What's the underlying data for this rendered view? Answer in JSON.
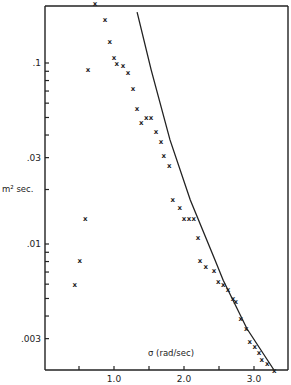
{
  "chart_data": {
    "type": "scatter",
    "title": "",
    "xlabel": "σ (rad/sec)",
    "ylabel": "m² sec.",
    "xlim": [
      0.0,
      3.5
    ],
    "ylim": [
      0.002,
      0.21
    ],
    "yscale": "log",
    "grid": false,
    "x_ticks": [
      {
        "value": 0.5,
        "label": ""
      },
      {
        "value": 1.0,
        "label": "1.0"
      },
      {
        "value": 1.5,
        "label": ""
      },
      {
        "value": 2.0,
        "label": "2.0"
      },
      {
        "value": 2.5,
        "label": ""
      },
      {
        "value": 3.0,
        "label": "3.0"
      }
    ],
    "y_ticks": [
      {
        "value": 0.1,
        "label": ".1"
      },
      {
        "value": 0.09,
        "label": ""
      },
      {
        "value": 0.08,
        "label": ""
      },
      {
        "value": 0.07,
        "label": ""
      },
      {
        "value": 0.06,
        "label": ""
      },
      {
        "value": 0.05,
        "label": ""
      },
      {
        "value": 0.04,
        "label": ""
      },
      {
        "value": 0.03,
        "label": ".03"
      },
      {
        "value": 0.02,
        "label": ""
      },
      {
        "value": 0.01,
        "label": ".01"
      },
      {
        "value": 0.009,
        "label": ""
      },
      {
        "value": 0.008,
        "label": ""
      },
      {
        "value": 0.007,
        "label": ""
      },
      {
        "value": 0.006,
        "label": ""
      },
      {
        "value": 0.005,
        "label": ""
      },
      {
        "value": 0.004,
        "label": ""
      },
      {
        "value": 0.003,
        "label": ".003"
      }
    ],
    "series": [
      {
        "name": "measured",
        "marker": "x",
        "points": [
          [
            0.73,
            0.214
          ],
          [
            0.87,
            0.175
          ],
          [
            0.94,
            0.131
          ],
          [
            1.0,
            0.107
          ],
          [
            1.04,
            0.099
          ],
          [
            1.13,
            0.097
          ],
          [
            1.2,
            0.089
          ],
          [
            0.63,
            0.092
          ],
          [
            1.27,
            0.072
          ],
          [
            1.33,
            0.056
          ],
          [
            1.39,
            0.047
          ],
          [
            1.46,
            0.05
          ],
          [
            1.53,
            0.05
          ],
          [
            1.6,
            0.042
          ],
          [
            1.67,
            0.037
          ],
          [
            1.71,
            0.031
          ],
          [
            1.79,
            0.027
          ],
          [
            1.84,
            0.0177
          ],
          [
            1.94,
            0.016
          ],
          [
            2.0,
            0.0139
          ],
          [
            2.07,
            0.0139
          ],
          [
            2.14,
            0.0139
          ],
          [
            2.2,
            0.0109
          ],
          [
            2.23,
            0.0081
          ],
          [
            2.31,
            0.0075
          ],
          [
            2.43,
            0.0071
          ],
          [
            2.49,
            0.0062
          ],
          [
            2.56,
            0.006
          ],
          [
            2.63,
            0.0056
          ],
          [
            2.7,
            0.005
          ],
          [
            2.74,
            0.0048
          ],
          [
            2.81,
            0.0039
          ],
          [
            2.89,
            0.0034
          ],
          [
            2.94,
            0.0029
          ],
          [
            3.01,
            0.0027
          ],
          [
            3.07,
            0.0025
          ],
          [
            3.11,
            0.0023
          ],
          [
            3.19,
            0.0022
          ],
          [
            3.29,
            0.002
          ],
          [
            0.59,
            0.0139
          ],
          [
            0.51,
            0.0081
          ],
          [
            0.44,
            0.006
          ]
        ]
      },
      {
        "name": "theory",
        "type": "line",
        "points": [
          [
            1.33,
            0.191
          ],
          [
            1.53,
            0.092
          ],
          [
            1.8,
            0.0376
          ],
          [
            2.09,
            0.0175
          ],
          [
            2.44,
            0.0082
          ],
          [
            2.56,
            0.0063
          ],
          [
            2.9,
            0.0034
          ],
          [
            3.29,
            0.002
          ]
        ]
      }
    ]
  }
}
